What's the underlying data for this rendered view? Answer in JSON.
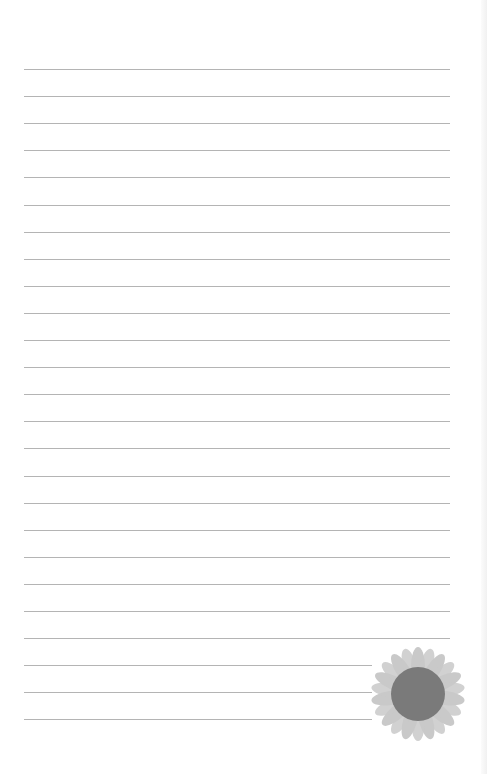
{
  "page": {
    "type": "lined-notepaper",
    "background": "#ffffff",
    "line_color": "#b4b4b4",
    "line_start_x": 24,
    "first_line_y": 69,
    "line_spacing": 27.1,
    "line_count": 25,
    "full_line_end_x": 450,
    "short_line_end_x": 372,
    "short_lines_from_index": 22
  },
  "decoration": {
    "icon": "sunflower-icon",
    "petal_color": "#c9c9c9",
    "disk_color": "#7a7a7a"
  }
}
